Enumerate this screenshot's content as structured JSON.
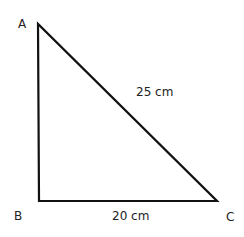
{
  "diagram": {
    "type": "right-triangle",
    "vertices": [
      {
        "label": "A",
        "x": 38,
        "y": 24
      },
      {
        "label": "B",
        "x": 39,
        "y": 201
      },
      {
        "label": "C",
        "x": 217,
        "y": 201
      }
    ],
    "right_angle_at": "B",
    "sides": [
      {
        "from": "A",
        "to": "C",
        "label": "25 cm"
      },
      {
        "from": "B",
        "to": "C",
        "label": "20 cm"
      }
    ],
    "stroke_color": "#111111",
    "text_color": "#222222"
  },
  "labels": {
    "A": "A",
    "B": "B",
    "C": "C",
    "hypotenuse": "25 cm",
    "base": "20 cm"
  }
}
